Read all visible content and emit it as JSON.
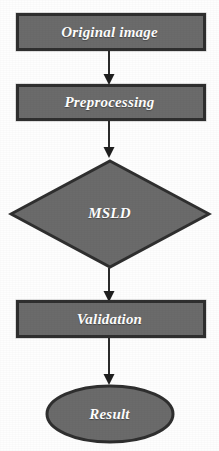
{
  "diagram": {
    "orientation": "top-to-bottom",
    "background_color": "#fefefe",
    "shape_fill_color": "#6b6b6b",
    "shape_border_color": "#2f2f2f",
    "label_color": "#ffffff",
    "connector_color": "#2b2b2b",
    "nodes": [
      {
        "id": "original-image",
        "label": "Original image",
        "shape": "rectangle"
      },
      {
        "id": "preprocessing",
        "label": "Preprocessing",
        "shape": "rectangle"
      },
      {
        "id": "msld",
        "label": "MSLD",
        "shape": "diamond"
      },
      {
        "id": "validation",
        "label": "Validation",
        "shape": "rectangle"
      },
      {
        "id": "result",
        "label": "Result",
        "shape": "ellipse"
      }
    ],
    "connectors": [
      {
        "id": "arrow-original-to-preprocessing",
        "from": "original-image",
        "to": "preprocessing",
        "style": "solid-arrow"
      },
      {
        "id": "arrow-preprocessing-to-msld",
        "from": "preprocessing",
        "to": "msld",
        "style": "solid-arrow"
      },
      {
        "id": "arrow-msld-to-validation",
        "from": "msld",
        "to": "validation",
        "style": "solid-arrow"
      },
      {
        "id": "arrow-validation-to-result",
        "from": "validation",
        "to": "result",
        "style": "solid-arrow"
      }
    ]
  }
}
